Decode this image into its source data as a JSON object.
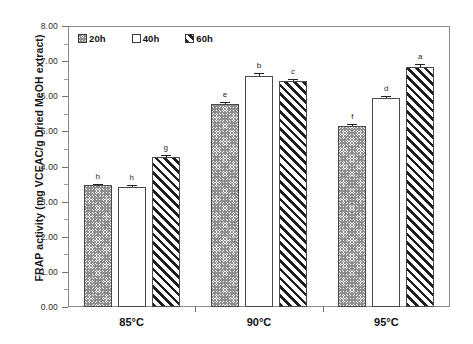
{
  "chart_data": {
    "type": "bar",
    "title": "",
    "xlabel": "",
    "ylabel": "FRAP activity (mg VCEAC/g Dried MeOH extract)",
    "categories": [
      "85°C",
      "90°C",
      "95°C"
    ],
    "ylim": [
      0.0,
      8.0
    ],
    "ytick_step": 1.0,
    "ytick_labels": [
      "0.00",
      "1.00",
      "2.00",
      "3.00",
      "4.00",
      "5.00",
      "6.00",
      "7.00",
      "8.00"
    ],
    "ytick_values": [
      0.0,
      1.0,
      2.0,
      3.0,
      4.0,
      5.0,
      6.0,
      7.0,
      8.0
    ],
    "grid": false,
    "legend_position": "top-left-inside",
    "series": [
      {
        "name": "20h",
        "pattern": "dense-crosshatch-gray",
        "values": [
          3.46,
          5.79,
          5.16
        ],
        "errors": [
          0.05,
          0.05,
          0.06
        ],
        "sig_letters": [
          "h",
          "e",
          "f"
        ]
      },
      {
        "name": "40h",
        "pattern": "light-dotted",
        "values": [
          3.42,
          6.58,
          5.95
        ],
        "errors": [
          0.05,
          0.08,
          0.07
        ],
        "sig_letters": [
          "h",
          "b",
          "d"
        ]
      },
      {
        "name": "60h",
        "pattern": "bold-diagonal-hatch",
        "values": [
          4.27,
          6.44,
          6.84
        ],
        "errors": [
          0.05,
          0.06,
          0.07
        ],
        "sig_letters": [
          "g",
          "c",
          "a"
        ]
      }
    ],
    "colors": {
      "axis": "#8a8a8a",
      "text": "#111111",
      "bar_outline": "#4a4a4a",
      "background": "#ffffff"
    }
  }
}
